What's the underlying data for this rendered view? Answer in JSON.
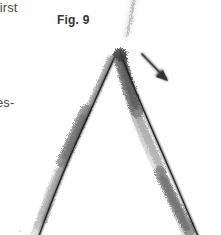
{
  "page": {
    "width": 221,
    "height": 235,
    "background_color": "#ffffff",
    "kind": "scanned-document-figure"
  },
  "text_fragments": {
    "top_left_fragment": "first",
    "left_margin_fragment": "es-"
  },
  "figure": {
    "caption": "Fig. 9",
    "caption_color": "#333333",
    "ink_color": "#2b2b2b",
    "smudge_color": "#8d8d8d",
    "annotations": [
      {
        "name": "pointer-arrow",
        "direction": "down-right",
        "from": [
          142,
          54
        ],
        "to": [
          168,
          81
        ]
      }
    ],
    "strokes": [
      {
        "name": "left-arm",
        "from": [
          117,
          52
        ],
        "to": [
          39,
          235
        ]
      },
      {
        "name": "right-arm",
        "from": [
          120,
          51
        ],
        "to": [
          198,
          235
        ]
      },
      {
        "name": "apex-smudge",
        "at": [
          120,
          55
        ]
      },
      {
        "name": "faint-top-streak",
        "from": [
          133,
          0
        ],
        "to": [
          126,
          36
        ]
      }
    ]
  }
}
